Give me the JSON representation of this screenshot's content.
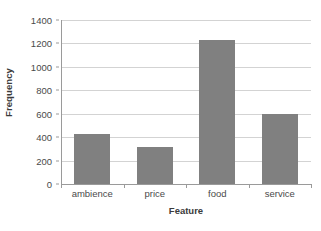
{
  "chart_data": {
    "type": "bar",
    "title": "",
    "xlabel": "Feature",
    "ylabel": "Frequency",
    "categories": [
      "ambience",
      "price",
      "food",
      "service"
    ],
    "values": [
      430,
      315,
      1230,
      600
    ],
    "series": [
      {
        "name": "Frequency",
        "values": [
          430,
          315,
          1230,
          600
        ]
      }
    ],
    "ylim": [
      0,
      1400
    ],
    "yticks": [
      0,
      200,
      400,
      600,
      800,
      1000,
      1200,
      1400
    ],
    "ytick_labels": [
      "0",
      "200",
      "400",
      "600",
      "800",
      "1000",
      "1200",
      "1400"
    ],
    "grid": "horizontal",
    "legend": "none",
    "bar_color": "#808080",
    "gridline_color": "#d3d3d3",
    "axis_color": "#9a9a9a",
    "text_color": "#3b3b3b"
  }
}
